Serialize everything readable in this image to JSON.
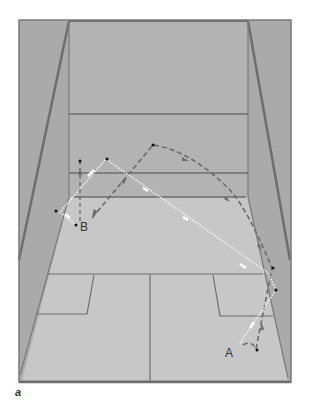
{
  "figure": {
    "caption": "a"
  },
  "colors": {
    "side_wall": "#ababab",
    "front_wall": "#b3b3b3",
    "floor": "#c6c6c6",
    "court_line": "#6e6e6e",
    "dashed_path": "#6b6b6b",
    "dotted_path": "#f2f2f2",
    "marker": "#111111",
    "label": "#333333"
  },
  "court": {
    "outer_frame": {
      "x1": 19,
      "y1": 20,
      "x2": 291,
      "y2": 383
    },
    "front_wall": {
      "left": 69,
      "right": 248,
      "top": 21,
      "bottom": 197
    },
    "out_line_y": 114,
    "service_line_y": 173,
    "tin_y": 197,
    "short_line_y": 274,
    "half_court_x": 150
  },
  "players": [
    {
      "id": "A",
      "label": "A",
      "x": 230,
      "y": 352
    },
    {
      "id": "B",
      "label": "B",
      "x": 84,
      "y": 226
    }
  ],
  "paths": [
    {
      "name": "dashed-shot-from-A",
      "style": "dashed",
      "description": "Shot from A off right side wall to front wall high, returning to B"
    },
    {
      "name": "dotted-shot-from-A",
      "style": "dotted",
      "description": "Shot from A off right wall, crossing court to front wall near B"
    },
    {
      "name": "dashed-shot-from-B",
      "style": "dashed",
      "description": "B moves up toward front wall"
    }
  ]
}
